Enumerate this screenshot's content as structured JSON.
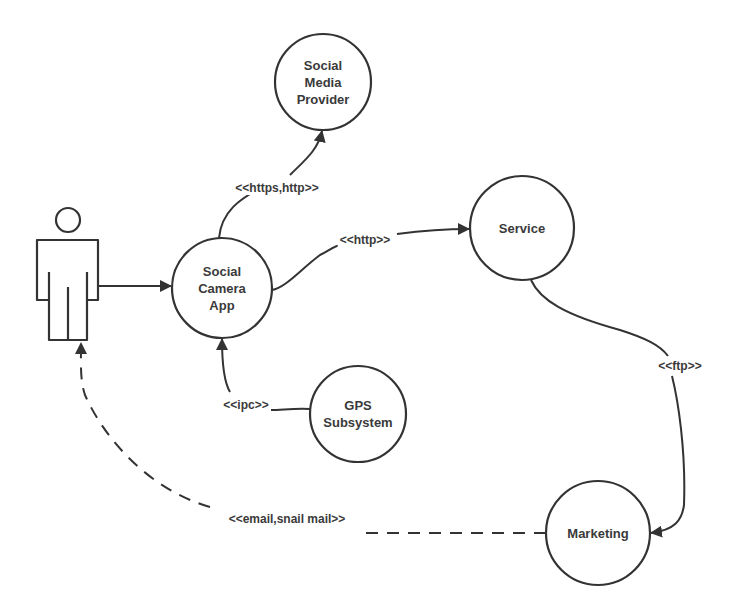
{
  "diagram": {
    "type": "UML deployment/use-case style diagram",
    "stroke_color": "#333333",
    "actor": {
      "name": "user"
    },
    "nodes": [
      {
        "id": "social-media-provider",
        "label": "Social\nMedia\nProvider",
        "cx": 323,
        "cy": 82,
        "r": 48
      },
      {
        "id": "social-camera-app",
        "label": "Social\nCamera\nApp",
        "cx": 222,
        "cy": 288,
        "r": 50
      },
      {
        "id": "service",
        "label": "Service",
        "cx": 522,
        "cy": 228,
        "r": 52
      },
      {
        "id": "gps-subsystem",
        "label": "GPS\nSubsystem",
        "cx": 358,
        "cy": 414,
        "r": 48
      },
      {
        "id": "marketing",
        "label": "Marketing",
        "cx": 598,
        "cy": 533,
        "r": 52
      }
    ],
    "edges": [
      {
        "from": "actor",
        "to": "social-camera-app",
        "label": "",
        "style": "solid"
      },
      {
        "from": "social-camera-app",
        "to": "social-media-provider",
        "label": "<<https,http>>",
        "style": "solid"
      },
      {
        "from": "social-camera-app",
        "to": "service",
        "label": "<<http>>",
        "style": "solid"
      },
      {
        "from": "gps-subsystem",
        "to": "social-camera-app",
        "label": "<<ipc>>",
        "style": "solid"
      },
      {
        "from": "service",
        "to": "marketing",
        "label": "<<ftp>>",
        "style": "solid"
      },
      {
        "from": "marketing",
        "to": "actor",
        "label": "<<email,snail mail>>",
        "style": "dashed"
      }
    ]
  }
}
